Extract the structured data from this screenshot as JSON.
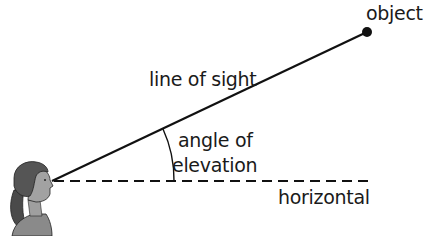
{
  "diagram": {
    "labels": {
      "object": "object",
      "line_of_sight": "line of sight",
      "angle_line1": "angle of",
      "angle_line2": "elevation",
      "horizontal": "horizontal"
    },
    "colors": {
      "line": "#111111",
      "text": "#1a1a1a",
      "hair": "#5a5a5a",
      "skin": "#9a9a9a",
      "shirt": "#7a7a7a"
    }
  }
}
